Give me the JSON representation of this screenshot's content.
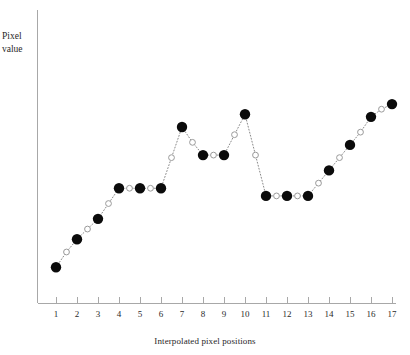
{
  "chart_data": {
    "type": "line",
    "title": "",
    "subtitle": "",
    "xlabel": "Interpolated pixel positions",
    "ylabel": "Pixel value",
    "ylabel_lines": [
      "Pixel",
      "value"
    ],
    "grid": false,
    "legend": "none",
    "xlim": [
      0.5,
      17.8
    ],
    "ylim": [
      0,
      100
    ],
    "xticks": [
      1,
      2,
      3,
      4,
      5,
      6,
      7,
      8,
      9,
      10,
      11,
      12,
      13,
      14,
      15,
      16,
      17
    ],
    "xtick_labels": [
      "1",
      "2",
      "3",
      "4",
      "5",
      "6",
      "7",
      "8",
      "9",
      "10",
      "11",
      "12",
      "13",
      "14",
      "15",
      "16",
      "17"
    ],
    "yticks": [],
    "ytick_labels": [],
    "marker_legend": {
      "filled": "original pixel sample",
      "open": "interpolated sample"
    },
    "series": [
      {
        "name": "Original pixel samples",
        "marker": "filled-circle",
        "marker_color": "#0b0b0b",
        "x": [
          1,
          2,
          3,
          4,
          5,
          6,
          7,
          8,
          9,
          10,
          11,
          12,
          13,
          14,
          15,
          16,
          17
        ],
        "values": [
          14,
          25,
          33,
          45,
          45,
          45,
          69,
          58,
          58,
          74,
          42,
          42,
          42,
          52,
          62,
          73,
          78
        ]
      },
      {
        "name": "Interpolated samples",
        "marker": "open-circle",
        "marker_color": "#ffffff",
        "x": [
          1.5,
          2.5,
          3.5,
          4.5,
          5.5,
          6.5,
          7.5,
          8.5,
          9.5,
          10.5,
          11.5,
          12.5,
          13.5,
          14.5,
          15.5,
          16.5
        ],
        "values": [
          20,
          29,
          39,
          45,
          45,
          57,
          63,
          58,
          66,
          58,
          42,
          42,
          47,
          57,
          67,
          76
        ]
      }
    ],
    "line_style": "dotted",
    "line_color": "#8a8a8a"
  },
  "axes": {
    "y_axis_name": "y-axis",
    "x_axis_name": "x-axis"
  }
}
